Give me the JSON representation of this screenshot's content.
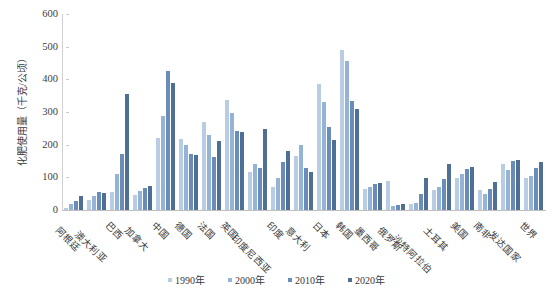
{
  "chart_data": {
    "type": "bar",
    "title": "",
    "xlabel": "",
    "ylabel": "化肥使用量（千克/公顷）",
    "ylim": [
      0,
      600
    ],
    "ytick_step": 100,
    "yticks": [
      "600",
      "500",
      "400",
      "300",
      "200",
      "100",
      "0"
    ],
    "grid": false,
    "legend_position": "bottom",
    "categories": [
      "阿根廷",
      "澳大利亚",
      "巴西",
      "加拿大",
      "中国",
      "德国",
      "法国",
      "英国",
      "印度尼西亚",
      "印度",
      "意大利",
      "日本",
      "韩国",
      "墨西哥",
      "俄罗斯",
      "沙特阿拉伯",
      "土耳其",
      "美国",
      "南非",
      "发达国家",
      "世界"
    ],
    "series": [
      {
        "name": "1990年",
        "color": "#b8cce4",
        "values": [
          5,
          32,
          55,
          45,
          220,
          218,
          268,
          337,
          115,
          70,
          164,
          385,
          490,
          65,
          88,
          18,
          60,
          98,
          61,
          140,
          99
        ]
      },
      {
        "name": "2000年",
        "color": "#95b3d7",
        "values": [
          18,
          43,
          110,
          57,
          288,
          199,
          230,
          298,
          142,
          98,
          198,
          330,
          455,
          70,
          12,
          20,
          70,
          110,
          49,
          123,
          105
        ]
      },
      {
        "name": "2010年",
        "color": "#6a8cb8",
        "values": [
          28,
          55,
          170,
          66,
          425,
          171,
          161,
          241,
          130,
          148,
          130,
          255,
          335,
          80,
          15,
          49,
          95,
          125,
          63,
          150,
          128
        ]
      },
      {
        "name": "2020年",
        "color": "#4f6f94",
        "values": [
          42,
          52,
          355,
          72,
          390,
          167,
          211,
          240,
          249,
          182,
          115,
          215,
          310,
          84,
          18,
          98,
          140,
          132,
          86,
          152,
          147
        ]
      }
    ],
    "legend": [
      "1990年",
      "2000年",
      "2010年",
      "2020年"
    ]
  }
}
